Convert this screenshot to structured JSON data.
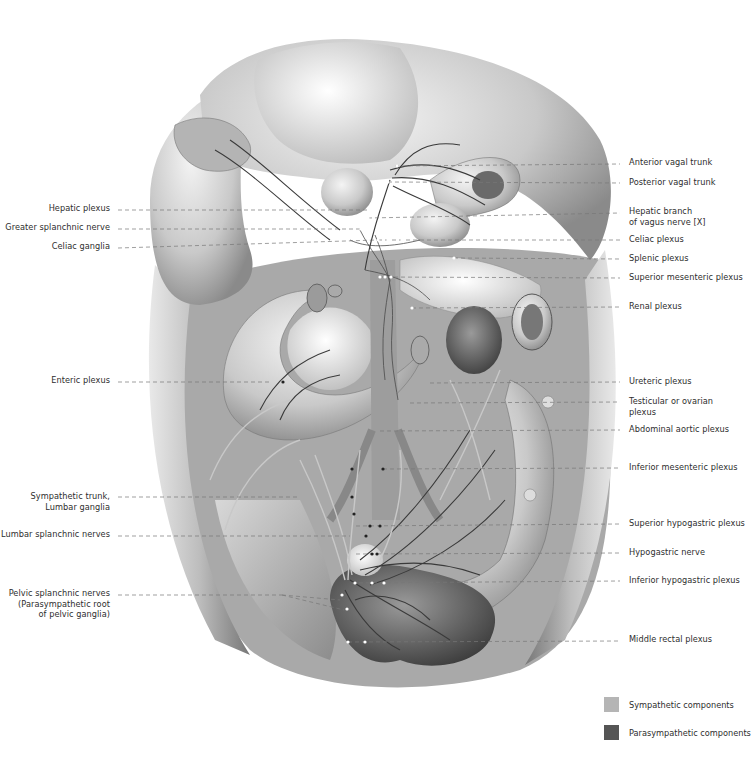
{
  "figure": {
    "colors": {
      "sympathetic": "#b5b5b5",
      "parasympathetic": "#555555",
      "leader_line": "#777777",
      "label_text": "#2e2e2e"
    }
  },
  "labels_left": [
    {
      "text": "Hepatic plexus",
      "lines": [
        "Hepatic plexus"
      ],
      "y": 208
    },
    {
      "text": "Greater splanchnic nerve",
      "lines": [
        "Greater splanchnic nerve"
      ],
      "y": 227
    },
    {
      "text": "Celiac ganglia",
      "lines": [
        "Celiac ganglia"
      ],
      "y": 246
    },
    {
      "text": "Enteric plexus",
      "lines": [
        "Enteric plexus"
      ],
      "y": 380
    },
    {
      "text": "Sympathetic trunk, Lumbar ganglia",
      "lines": [
        "Sympathetic trunk,",
        "Lumbar ganglia"
      ],
      "y": 496
    },
    {
      "text": "Lumbar splanchnic nerves",
      "lines": [
        "Lumbar splanchnic nerves"
      ],
      "y": 534
    },
    {
      "text": "Pelvic splanchnic nerves (Parasympathetic root of pelvic ganglia)",
      "lines": [
        "Pelvic splanchnic nerves",
        "(Parasympathetic root",
        "of pelvic ganglia)"
      ],
      "y": 593
    }
  ],
  "labels_right": [
    {
      "text": "Anterior vagal trunk",
      "lines": [
        "Anterior vagal trunk"
      ],
      "y": 163
    },
    {
      "text": "Posterior vagal trunk",
      "lines": [
        "Posterior vagal trunk"
      ],
      "y": 182
    },
    {
      "text": "Hepatic branch of vagus nerve [X]",
      "lines": [
        "Hepatic branch",
        "of vagus nerve [X]"
      ],
      "y": 211
    },
    {
      "text": "Celiac plexus",
      "lines": [
        "Celiac plexus"
      ],
      "y": 239
    },
    {
      "text": "Splenic plexus",
      "lines": [
        "Splenic plexus"
      ],
      "y": 258
    },
    {
      "text": "Superior mesenteric plexus",
      "lines": [
        "Superior mesenteric plexus"
      ],
      "y": 277
    },
    {
      "text": "Renal plexus",
      "lines": [
        "Renal plexus"
      ],
      "y": 306
    },
    {
      "text": "Ureteric plexus",
      "lines": [
        "Ureteric plexus"
      ],
      "y": 381
    },
    {
      "text": "Testicular or ovarian plexus",
      "lines": [
        "Testicular or ovarian",
        "plexus"
      ],
      "y": 400
    },
    {
      "text": "Abdominal aortic plexus",
      "lines": [
        "Abdominal aortic plexus"
      ],
      "y": 429
    },
    {
      "text": "Inferior mesenteric plexus",
      "lines": [
        "Inferior mesenteric plexus"
      ],
      "y": 467
    },
    {
      "text": "Superior hypogastric plexus",
      "lines": [
        "Superior hypogastric plexus"
      ],
      "y": 523
    },
    {
      "text": "Hypogastric nerve",
      "lines": [
        "Hypogastric nerve"
      ],
      "y": 552
    },
    {
      "text": "Inferior hypogastric plexus",
      "lines": [
        "Inferior hypogastric plexus"
      ],
      "y": 580
    },
    {
      "text": "Middle rectal plexus",
      "lines": [
        "Middle rectal plexus"
      ],
      "y": 639
    }
  ],
  "legend": {
    "items": [
      {
        "label": "Sympathetic components",
        "color": "#b5b5b5"
      },
      {
        "label": "Parasympathetic components",
        "color": "#555555"
      }
    ]
  }
}
